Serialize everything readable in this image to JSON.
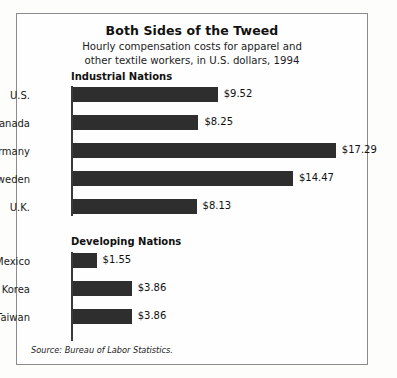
{
  "chart_data": {
    "type": "bar",
    "orientation": "horizontal",
    "title": "Both Sides of the Tweed",
    "subtitle_line1": "Hourly compensation costs for apparel and",
    "subtitle_line2": "other textile workers, in U.S. dollars, 1994",
    "xlabel": "",
    "ylabel": "",
    "grid": false,
    "legend": "none",
    "value_prefix": "$",
    "xlim": [
      0,
      17.29
    ],
    "groups": [
      {
        "name": "industrial",
        "heading": "Industrial Nations",
        "categories": [
          "U.S.",
          "Canada",
          "Germany",
          "Sweden",
          "U.K."
        ],
        "values": [
          9.52,
          8.25,
          17.29,
          14.47,
          8.13
        ],
        "labels": [
          "$9.52",
          "$8.25",
          "$17.29",
          "$14.47",
          "$8.13"
        ]
      },
      {
        "name": "developing",
        "heading": "Developing Nations",
        "categories": [
          "Mexico",
          "Korea",
          "Taiwan"
        ],
        "values": [
          1.55,
          3.86,
          3.86
        ],
        "labels": [
          "$1.55",
          "$3.86",
          "$3.86"
        ]
      }
    ],
    "source": "Source: Bureau of Labor Statistics.",
    "bar_color": "#2e2e2e",
    "axis_color": "#3a3a3a",
    "background_color": "#fefefe"
  }
}
